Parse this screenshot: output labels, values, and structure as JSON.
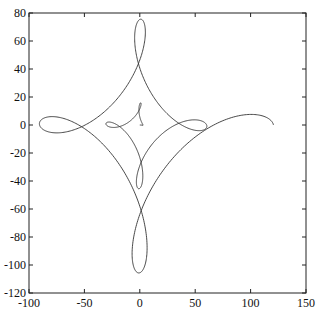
{
  "chart_data": {
    "type": "line",
    "title": "",
    "xlabel": "",
    "ylabel": "",
    "xlim": [
      -100,
      150
    ],
    "ylim": [
      -120,
      80
    ],
    "xticks": [
      -100,
      -50,
      0,
      50,
      100,
      150
    ],
    "yticks": [
      -120,
      -100,
      -80,
      -60,
      -40,
      -20,
      0,
      20,
      40,
      60,
      80
    ],
    "grid": false,
    "legend": null,
    "series": [
      {
        "name": "spiral-trochoid",
        "description": "Outward-growing looped spiral starting near origin and ending near (120, 0)",
        "parametric": {
          "form": "z(t) = s * t * (a*e^{i t} + b*e^{i k t})",
          "s": 6.4,
          "a": 1.0,
          "b": 0.5,
          "k": -3,
          "t_start": 0,
          "t_end": 12.566,
          "samples": 1200
        },
        "key_points": [
          {
            "x": 0,
            "y": 0,
            "note": "start near origin"
          },
          {
            "x": -13,
            "y": 18,
            "note": "inner loop"
          },
          {
            "x": 25,
            "y": 18,
            "note": "inner loop"
          },
          {
            "x": 30,
            "y": -20,
            "note": "inner loop"
          },
          {
            "x": -13,
            "y": -20,
            "note": "inner loop"
          },
          {
            "x": 0,
            "y": 45,
            "note": "outer loop"
          },
          {
            "x": 30,
            "y": -40,
            "note": "outer loop"
          },
          {
            "x": -40,
            "y": -25,
            "note": "outer loop"
          },
          {
            "x": -35,
            "y": 68,
            "note": "top of upper-left lobe"
          },
          {
            "x": 20,
            "y": 60,
            "note": "top of upper-right lobe"
          },
          {
            "x": -10,
            "y": -105,
            "note": "bottom of lower lobe"
          },
          {
            "x": 50,
            "y": -68,
            "note": "bottom of final arc"
          },
          {
            "x": 120,
            "y": -2,
            "note": "end point"
          }
        ]
      }
    ]
  },
  "axes": {
    "frame_color": "#222222",
    "line_color": "#333333"
  }
}
